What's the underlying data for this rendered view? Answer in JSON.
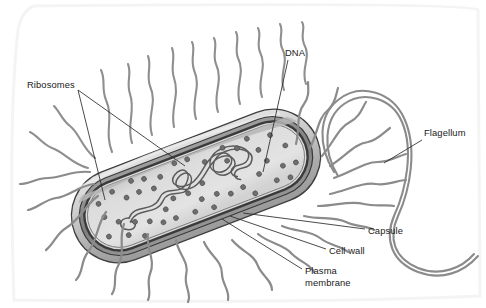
{
  "figure": {
    "style": "grayscale pen-and-ink textbook illustration",
    "background_color": "#ffffff"
  },
  "labels": [
    {
      "id": "ribosomes",
      "text": "Ribosomes",
      "x": 27,
      "y": 85,
      "anchor": "left"
    },
    {
      "id": "dna",
      "text": "DNA",
      "x": 285,
      "y": 53,
      "anchor": "left"
    },
    {
      "id": "flagellum",
      "text": "Flagellum",
      "x": 424,
      "y": 133,
      "anchor": "left"
    },
    {
      "id": "capsule",
      "text": "Capsule",
      "x": 368,
      "y": 231,
      "anchor": "left"
    },
    {
      "id": "cell-wall",
      "text": "Cell wall",
      "x": 329,
      "y": 251,
      "anchor": "left"
    },
    {
      "id": "plasma-membrane",
      "text": "Plasma\nmembrane",
      "x": 305,
      "y": 271,
      "anchor": "left"
    }
  ],
  "colors": {
    "capsule_fill": "#b9b9b9",
    "capsule_top_highlight": "#d5d5d5",
    "cell_wall": "#8f8f8f",
    "plasma_membrane": "#4a4a4a",
    "cytoplasm": "#dcdcdc",
    "cytoplasm_shadow": "#c6c6c6",
    "ribosome_dot": "#6e6e6e",
    "dna_strand": "#5d5d5d",
    "pilus": "#8b8b8b",
    "flagellum": "#8b8b8b",
    "outline": "#3a3a3a",
    "leader_line": "#2b2b2b",
    "label_text": "#1a1a1a",
    "scan_border": "#f2f2f2"
  },
  "cell_body": {
    "shape": "rod (bacillus) with hemispherical ends",
    "rotation_deg": -21,
    "center_x": 196,
    "center_y": 186,
    "length": 260,
    "width": 92,
    "envelope_layers": [
      "capsule",
      "cell wall",
      "plasma membrane"
    ]
  },
  "ribosome_count": 68,
  "pili_count": 34,
  "flagella_count": 1,
  "leader_lines": [
    {
      "from": "ribosomes",
      "x1": 78,
      "y1": 90,
      "x2": 185,
      "y2": 166
    },
    {
      "from": "ribosomes",
      "x1": 78,
      "y1": 90,
      "x2": 105,
      "y2": 200
    },
    {
      "from": "dna",
      "x1": 288,
      "y1": 60,
      "x2": 263,
      "y2": 172
    },
    {
      "from": "flagellum",
      "x1": 422,
      "y1": 140,
      "x2": 384,
      "y2": 163
    },
    {
      "from": "capsule",
      "x1": 365,
      "y1": 229,
      "x2": 243,
      "y2": 213
    },
    {
      "from": "cell-wall",
      "x1": 326,
      "y1": 249,
      "x2": 230,
      "y2": 216
    },
    {
      "from": "plasma-membrane",
      "x1": 302,
      "y1": 269,
      "x2": 222,
      "y2": 219
    }
  ]
}
